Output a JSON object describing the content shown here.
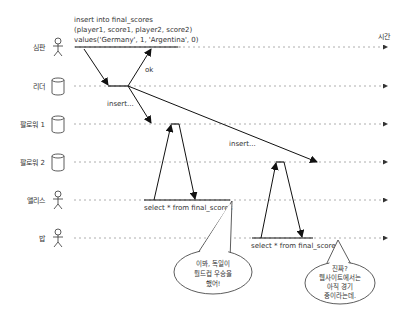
{
  "diagram": {
    "time_label": "시간",
    "actors": [
      {
        "label": "심판",
        "type": "person",
        "y": 47
      },
      {
        "label": "리더",
        "type": "database",
        "y": 86
      },
      {
        "label": "팔로워 1",
        "type": "database",
        "y": 124
      },
      {
        "label": "팔로워 2",
        "type": "database",
        "y": 162
      },
      {
        "label": "앨리스",
        "type": "person",
        "y": 200
      },
      {
        "label": "밥",
        "type": "person",
        "y": 238
      }
    ],
    "messages": {
      "insert_line1": "insert into final_scores",
      "insert_line2": "(player1, score1, player2, score2)",
      "insert_line3": "values('Germany', 1, 'Argentina', 0)",
      "ok": "ok",
      "insert_f1": "insert...",
      "insert_f2": "insert...",
      "alice_select": "select * from final_scores",
      "bob_select": "select * from final_scores"
    },
    "bubbles": {
      "alice": {
        "line1": "이봐, 독일이",
        "line2": "월드컵 우승을",
        "line3": "했어!"
      },
      "bob": {
        "line1": "진짜?",
        "line2": "웹사이트에서는",
        "line3": "아직 경기",
        "line4": "중이라는데."
      }
    }
  }
}
